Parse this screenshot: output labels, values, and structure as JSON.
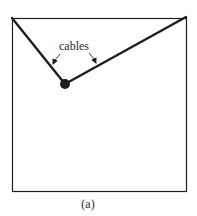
{
  "figure": {
    "caption": "(a)",
    "annotation_label": "cables",
    "colors": {
      "stroke": "#1e1e1e",
      "background": "#ffffff"
    },
    "box": {
      "x": 12,
      "y": 18,
      "width": 174,
      "height": 174
    },
    "mass": {
      "cx": 65,
      "cy": 84,
      "r": 5
    },
    "cables": [
      {
        "name": "left-cable",
        "x1": 12,
        "y1": 18,
        "x2": 65,
        "y2": 84
      },
      {
        "name": "right-cable",
        "x1": 65,
        "y1": 84,
        "x2": 186,
        "y2": 17
      }
    ]
  }
}
